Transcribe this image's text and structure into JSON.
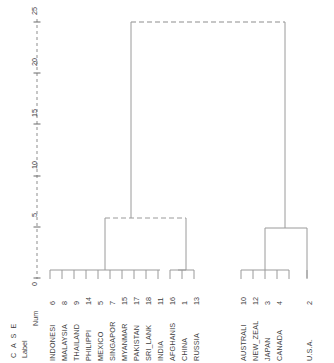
{
  "figure": {
    "type": "dendrogram",
    "title": "",
    "header_case": "C A S E",
    "header_label": "Label",
    "header_num": "Num",
    "axis_title": "",
    "axis_ticks": [
      "0",
      "5",
      "10",
      "15",
      "20",
      "25"
    ]
  },
  "chart_data": {
    "type": "line",
    "subtype": "dendrogram",
    "title": "",
    "xlabel": "",
    "ylabel": "Rescaled Distance Cluster Combine",
    "ylim": [
      0,
      26
    ],
    "grid": false,
    "legend": null,
    "orientation": "vertical",
    "axis_ticks": [
      0,
      5,
      10,
      15,
      20,
      25
    ],
    "categories": [
      "INDONESI",
      "MALAYSIA",
      "THAILAND",
      "PHILIPPI",
      "MEXICO",
      "SINGAPOR",
      "MYANMAR",
      "PAKISTAN",
      "SRI_LANK",
      "INDIA",
      "AFGHANIS",
      "CHINA",
      "RUSSIA",
      "AUSTRALI",
      "NEW_ZEAL",
      "JAPAN",
      "CANADA",
      "U.S.A."
    ],
    "case_numbers": [
      6,
      8,
      9,
      14,
      5,
      7,
      15,
      17,
      18,
      11,
      16,
      1,
      13,
      10,
      12,
      3,
      4,
      2
    ],
    "leaves": [
      {
        "label": "INDONESI",
        "num": 6
      },
      {
        "label": "MALAYSIA",
        "num": 8
      },
      {
        "label": "THAILAND",
        "num": 9
      },
      {
        "label": "PHILIPPI",
        "num": 14
      },
      {
        "label": "MEXICO",
        "num": 5
      },
      {
        "label": "SINGAPOR",
        "num": 7
      },
      {
        "label": "MYANMAR",
        "num": 15
      },
      {
        "label": "PAKISTAN",
        "num": 17
      },
      {
        "label": "SRI_LANK",
        "num": 18
      },
      {
        "label": "INDIA",
        "num": 11
      },
      {
        "label": "AFGHANIS",
        "num": 16
      },
      {
        "label": "CHINA",
        "num": 1
      },
      {
        "label": "RUSSIA",
        "num": 13
      },
      {
        "label": "AUSTRALI",
        "num": 10
      },
      {
        "label": "NEW_ZEAL",
        "num": 12
      },
      {
        "label": "JAPAN",
        "num": 3
      },
      {
        "label": "CANADA",
        "num": 4
      },
      {
        "label": "U.S.A.",
        "num": 2
      }
    ],
    "merges": [
      {
        "id": "m1",
        "members": [
          "INDONESI",
          "MALAYSIA"
        ],
        "height": 0.6
      },
      {
        "id": "m2",
        "members": [
          "THAILAND",
          "PHILIPPI"
        ],
        "height": 0.6
      },
      {
        "id": "m3",
        "members": [
          "MEXICO",
          "SINGAPOR"
        ],
        "height": 0.6
      },
      {
        "id": "m4",
        "members": [
          "MYANMAR",
          "PAKISTAN"
        ],
        "height": 0.6
      },
      {
        "id": "m5",
        "members": [
          "SRI_LANK",
          "INDIA"
        ],
        "height": 0.6
      },
      {
        "id": "m6",
        "members": [
          "AFGHANIS",
          "CHINA"
        ],
        "height": 0.6
      },
      {
        "id": "m7",
        "members": [
          "RUSSIA"
        ],
        "height": 0.6
      },
      {
        "id": "m8",
        "members": [
          "AUSTRALI",
          "NEW_ZEAL"
        ],
        "height": 0.6
      },
      {
        "id": "m9",
        "members": [
          "JAPAN",
          "CANADA"
        ],
        "height": 0.6
      },
      {
        "id": "m10",
        "members": [
          "m1...m6 group"
        ],
        "height": 6.0
      },
      {
        "id": "m11",
        "members": [
          "m8",
          "m9"
        ],
        "height": 5.0
      },
      {
        "id": "m12",
        "members": [
          "m10",
          "m11"
        ],
        "height": 25.0
      }
    ],
    "clusters": {
      "left_cluster_height": 6.0,
      "right_cluster_height": 5.0,
      "root_height": 25.0,
      "left_cluster_members": [
        "INDONESI",
        "MALAYSIA",
        "THAILAND",
        "PHILIPPI",
        "MEXICO",
        "SINGAPOR",
        "MYANMAR",
        "PAKISTAN",
        "SRI_LANK",
        "INDIA",
        "AFGHANIS",
        "CHINA",
        "RUSSIA"
      ],
      "right_cluster_members": [
        "AUSTRALI",
        "NEW_ZEAL",
        "JAPAN",
        "CANADA",
        "U.S.A."
      ]
    }
  }
}
